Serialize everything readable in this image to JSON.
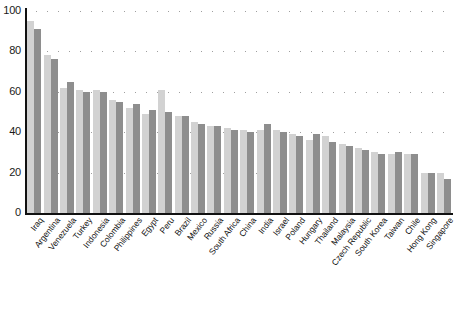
{
  "chart_data": {
    "type": "bar",
    "title": "",
    "subtitle": "",
    "xlabel": "",
    "ylabel": "",
    "ylim": [
      0,
      100
    ],
    "yticks": [
      0,
      20,
      40,
      60,
      80,
      100
    ],
    "ytick_labels": [
      "0",
      "20",
      "40",
      "60",
      "80",
      "100"
    ],
    "grid": "dotted-horizontal",
    "legend": "none",
    "legend_position": "none",
    "orientation": "vertical",
    "bar_style": "grouped-pairs",
    "categories": [
      "Iraq",
      "Argentina",
      "Venezuela",
      "Turkey",
      "Indonesia",
      "Colombia",
      "Philippines",
      "Egypt",
      "Peru",
      "Brazil",
      "Mexico",
      "Russia",
      "South Africa",
      "China",
      "India",
      "Israel",
      "Poland",
      "Hungary",
      "Thailand",
      "Malaysia",
      "Czech Republic",
      "South Korea",
      "Taiwan",
      "Chile",
      "Hong Kong",
      "Singapore"
    ],
    "series": [
      {
        "name": "series-1",
        "color": "#d2d2d2",
        "values": [
          95,
          78,
          62,
          61,
          61,
          56,
          52,
          49,
          61,
          48,
          45,
          43,
          42,
          41,
          41,
          41,
          39,
          36,
          38,
          34,
          32,
          30,
          29,
          29,
          20,
          20
        ]
      },
      {
        "name": "series-2",
        "color": "#8e8e8e",
        "values": [
          91,
          76,
          65,
          60,
          60,
          55,
          54,
          51,
          50,
          48,
          44,
          43,
          41,
          40,
          44,
          40,
          38,
          39,
          35,
          33,
          31,
          29,
          30,
          29,
          20,
          17
        ]
      }
    ],
    "colors": {
      "series_light": "#d2d2d2",
      "series_dark": "#8e8e8e",
      "axis": "#111111",
      "grid": "#9a9a9a",
      "background": "#ffffff"
    }
  },
  "footnote": ""
}
